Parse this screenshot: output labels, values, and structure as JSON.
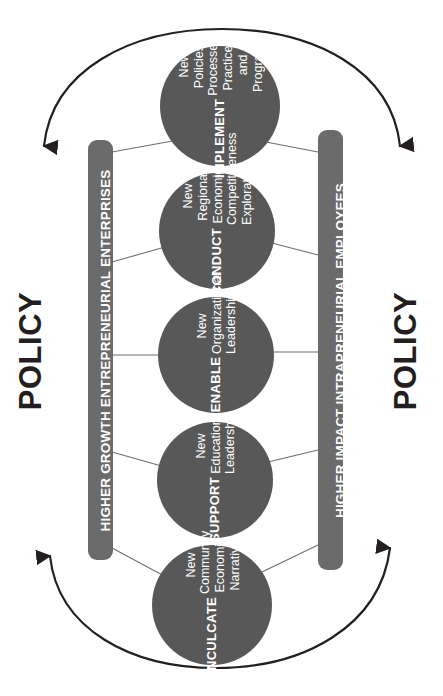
{
  "diagram": {
    "colors": {
      "circle_fill": "#585858",
      "bar_fill": "#6b6b6b",
      "arrow_stroke": "#231f20",
      "connector_stroke": "#6f6f6f",
      "label_text": "#ffffff",
      "policy_text": "#231f20",
      "background": "#ffffff"
    },
    "policy_labels": [
      {
        "name": "policy-left",
        "text": "POLICY"
      },
      {
        "name": "policy-right",
        "text": "POLICY"
      }
    ],
    "bars": [
      {
        "name": "bar-left",
        "text": "HIGHER GROWTH ENTREPRENEURIAL ENTERPRISES"
      },
      {
        "name": "bar-right",
        "text": "HIGHER IMPACT INTRAPRENEURIAL EMPLOYEES"
      }
    ],
    "nodes": [
      {
        "name": "node-implement",
        "title": "IMPLEMENT",
        "desc": "New Policies, Processes, Practices and Programs",
        "cx": 220,
        "cy": 106,
        "r": 60
      },
      {
        "name": "node-conduct",
        "title": "CONDUCT",
        "desc": "New Regional Economic Competitiveness Exploration",
        "cx": 217,
        "cy": 231,
        "r": 58
      },
      {
        "name": "node-enable",
        "title": "ENABLE",
        "desc": "New Organizational Leadership",
        "cx": 216,
        "cy": 355,
        "r": 58
      },
      {
        "name": "node-support",
        "title": "SUPPORT",
        "desc": "New Education Leadership",
        "cx": 215,
        "cy": 480,
        "r": 58
      },
      {
        "name": "node-inculcate",
        "title": "INCULCATE",
        "desc": "New Community Economic Narrative",
        "cx": 212,
        "cy": 605,
        "r": 60
      }
    ],
    "arcs": [
      {
        "name": "arc-top",
        "direction": "downward-arrowheads-both-ends"
      },
      {
        "name": "arc-bottom",
        "direction": "upward-arrowheads-both-ends"
      }
    ]
  }
}
